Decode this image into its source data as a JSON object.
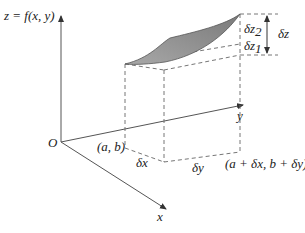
{
  "figure": {
    "labels": {
      "z_axis": "z = f(x, y)",
      "origin": "O",
      "y_axis": "y",
      "x_axis": "x",
      "point_a_b": "(a, b)",
      "point_a_dx_b_dy": "(a + δx, b + δy)",
      "delta_x": "δx",
      "delta_y": "δy",
      "delta_z": "δz",
      "delta_z1": "δz",
      "delta_z1_sub": "1",
      "delta_z2": "δz",
      "delta_z2_sub": "2"
    },
    "colors": {
      "surface_fill": "#8c8c8c",
      "surface_edge": "#555555",
      "axis": "#555555",
      "dashed": "#666666"
    }
  }
}
